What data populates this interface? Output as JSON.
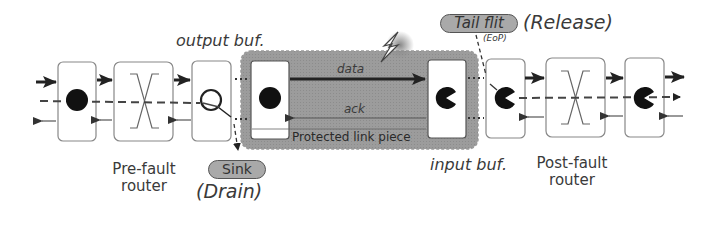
{
  "labels": {
    "output_buf": "output buf.",
    "input_buf": "input buf.",
    "pre_fault_router_line1": "Pre-fault",
    "pre_fault_router_line2": "router",
    "post_fault_router_line1": "Post-fault",
    "post_fault_router_line2": "router",
    "data": "data",
    "ack": "ack",
    "protected_link": "Protected link piece",
    "sink": "Sink",
    "drain": "(Drain)",
    "tail_flit": "Tail flit",
    "eop": "(EoP)",
    "release": "(Release)"
  },
  "colors": {
    "protected_region": "#9a9a9a",
    "pill_fill": "#a9a9a9",
    "stroke": "#333333",
    "box_border": "#888888"
  }
}
